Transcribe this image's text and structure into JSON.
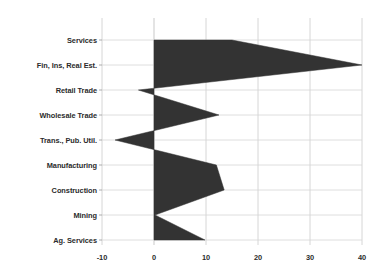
{
  "chart_data": {
    "type": "area",
    "title": "",
    "xlabel": "",
    "ylabel": "",
    "orientation": "horizontal",
    "grid": true,
    "legend": "none",
    "xlim": [
      -10,
      40
    ],
    "xticks": [
      -10,
      0,
      10,
      20,
      30,
      40
    ],
    "xtick_labels": [
      "-10",
      "0",
      "10",
      "20",
      "30",
      "40"
    ],
    "categories": [
      "Services",
      "Fin, Ins, Real Est.",
      "Retail Trade",
      "Wholesale Trade",
      "Trans., Pub. Util.",
      "Manufacturing",
      "Construction",
      "Mining",
      "Ag. Services"
    ],
    "values": [
      15,
      40,
      -3,
      12.5,
      -7.5,
      12,
      13.5,
      0.2,
      9.8
    ],
    "series": [
      {
        "name": "Percent Change",
        "values": [
          15,
          40,
          -3,
          12.5,
          -7.5,
          12,
          13.5,
          0.2,
          9.8
        ]
      }
    ],
    "colors": {
      "fill": "#333333",
      "grid": "#d6d6d6",
      "zero_line": "#c9c9c9",
      "text": "#2b2b2b",
      "background": "#ffffff"
    }
  },
  "axis": {
    "y_labels": [
      {
        "label": "Services"
      },
      {
        "label": "Fin, Ins, Real Est."
      },
      {
        "label": "Retail Trade"
      },
      {
        "label": "Wholesale Trade"
      },
      {
        "label": "Trans., Pub. Util."
      },
      {
        "label": "Manufacturing"
      },
      {
        "label": "Construction"
      },
      {
        "label": "Mining"
      },
      {
        "label": "Ag. Services"
      }
    ],
    "x_labels": [
      {
        "label": "-10"
      },
      {
        "label": "0"
      },
      {
        "label": "10"
      },
      {
        "label": "20"
      },
      {
        "label": "30"
      },
      {
        "label": "40"
      }
    ]
  }
}
